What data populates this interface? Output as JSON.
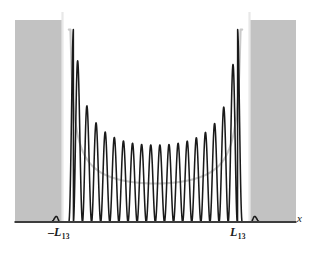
{
  "figure": {
    "title": "",
    "background_color": "#ffffff",
    "width": 316,
    "height": 256
  },
  "labels": {
    "x_axis": "x",
    "left_turning_point_sign": "–",
    "left_turning_point_symbol": "L",
    "left_turning_point_subscript": "13",
    "right_turning_point_symbol": "L",
    "right_turning_point_subscript": "13"
  },
  "colors": {
    "quantum_curve": "#1a1a1a",
    "classical_curve": "#c9c9c9",
    "forbidden_region_fill": "#c2c2c2",
    "axis_line": "#3d3d3d",
    "turning_point_line": "#e8e8e8",
    "background": "#ffffff"
  },
  "chart_data": {
    "type": "line",
    "title": "",
    "xlabel": "x",
    "ylabel": "",
    "quantum_number": 13,
    "n_peaks": 19,
    "xlim": [
      -1.62,
      1.62
    ],
    "ylim": [
      0,
      1.05
    ],
    "grid": false,
    "legend": "none",
    "annotations": [
      {
        "text": "–L13",
        "x": -1.0,
        "y": 0,
        "role": "left-turning-point"
      },
      {
        "text": "L13",
        "x": 1.0,
        "y": 0,
        "role": "right-turning-point"
      },
      {
        "text": "x",
        "x": 1.62,
        "y": 0,
        "role": "axis-label"
      }
    ],
    "turning_points": [
      -1.0,
      1.0
    ],
    "forbidden_regions": [
      {
        "from": -1.62,
        "to": -1.0
      },
      {
        "from": 1.0,
        "to": 1.62
      }
    ],
    "series": [
      {
        "name": "quantum-probability-density",
        "style": "solid-dark",
        "peak_x": [
          -0.947,
          -0.842,
          -0.737,
          -0.632,
          -0.526,
          -0.421,
          -0.316,
          -0.211,
          -0.105,
          0.0,
          0.105,
          0.211,
          0.316,
          0.421,
          0.526,
          0.632,
          0.737,
          0.842,
          0.947
        ],
        "peak_y": [
          1.0,
          0.66,
          0.545,
          0.485,
          0.45,
          0.428,
          0.414,
          0.405,
          0.401,
          0.4,
          0.401,
          0.405,
          0.414,
          0.428,
          0.45,
          0.485,
          0.545,
          0.66,
          1.0
        ]
      },
      {
        "name": "classical-probability-density",
        "style": "solid-light",
        "x": [
          -1.0,
          -0.9,
          -0.8,
          -0.7,
          -0.6,
          -0.5,
          -0.4,
          -0.3,
          -0.2,
          -0.1,
          0.0,
          0.1,
          0.2,
          0.3,
          0.4,
          0.5,
          0.6,
          0.7,
          0.8,
          0.9,
          1.0
        ],
        "y": [
          1.0,
          0.459,
          0.333,
          0.28,
          0.25,
          0.231,
          0.218,
          0.21,
          0.204,
          0.201,
          0.2,
          0.201,
          0.204,
          0.21,
          0.218,
          0.231,
          0.25,
          0.28,
          0.333,
          0.459,
          1.0
        ]
      }
    ]
  }
}
